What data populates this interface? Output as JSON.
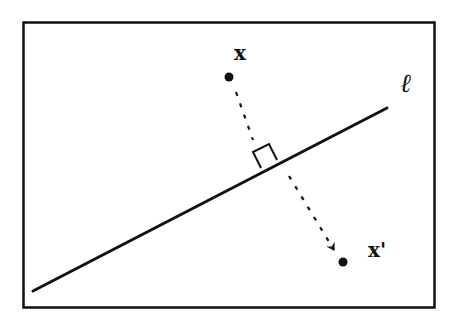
{
  "diagram": {
    "type": "reflection-across-line",
    "colors": {
      "background": "#ffffff",
      "ink": "#111111"
    },
    "frame": {
      "x": 23,
      "y": 22,
      "width": 411,
      "height": 285
    },
    "line": {
      "label": "ℓ",
      "start": {
        "x": 33,
        "y": 291
      },
      "end": {
        "x": 387,
        "y": 108
      }
    },
    "point_x": {
      "label": "x",
      "position": {
        "x": 229,
        "y": 77
      }
    },
    "point_x_prime": {
      "label": "x'",
      "position": {
        "x": 343,
        "y": 262
      }
    },
    "projection_foot": {
      "x": 266,
      "y": 157
    },
    "right_angle_marker": true,
    "arrow": {
      "style": "dashed",
      "from": "x",
      "to": "x'"
    }
  }
}
